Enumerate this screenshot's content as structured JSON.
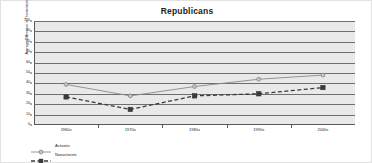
{
  "chart_data": {
    "type": "line",
    "title": "Republicans",
    "xlabel": "",
    "ylabel": "Average Difference in Thermometer Scores",
    "categories": [
      "1960s",
      "1970s",
      "1980s",
      "1990s",
      "2000s"
    ],
    "ylim": [
      0,
      100
    ],
    "ytick_step": 10,
    "yticks": [
      0,
      10,
      20,
      30,
      40,
      50,
      60,
      70,
      80,
      90,
      100
    ],
    "grid": true,
    "legend_position": "bottom-left",
    "series": [
      {
        "name": "Activists",
        "values": [
          39,
          28,
          37,
          44,
          48
        ],
        "color": "#8a8a8a",
        "line_style": "solid",
        "marker": "circle"
      },
      {
        "name": "Nonactivists",
        "values": [
          27,
          15,
          28,
          30,
          36
        ],
        "color": "#3a3a3a",
        "line_style": "dashed",
        "marker": "square"
      }
    ]
  }
}
